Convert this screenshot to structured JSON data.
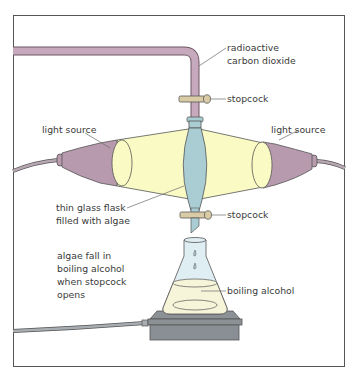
{
  "labels": {
    "radioactive_line1": "radioactive",
    "radioactive_line2": "carbon dioxide",
    "stopcock_top": "stopcock",
    "light_source_left": "light source",
    "light_source_right": "light source",
    "flask_line1": "thin glass flask",
    "flask_line2": "filled with algae",
    "stopcock_bottom": "stopcock",
    "algae_line1": "algae fall in",
    "algae_line2": "boiling alcohol",
    "algae_line3": "when stopcock",
    "algae_line4": "opens",
    "boiling_alcohol": "boiling alcohol"
  },
  "colors": {
    "tube": "#c7a9bd",
    "light_beam": "#fafbc4",
    "flask": "#a9cdd3",
    "lamp": "#b79aae",
    "stopcock": "#d9cba6",
    "hotplate": "#8c9196",
    "alcohol": "#f6f5d9"
  }
}
